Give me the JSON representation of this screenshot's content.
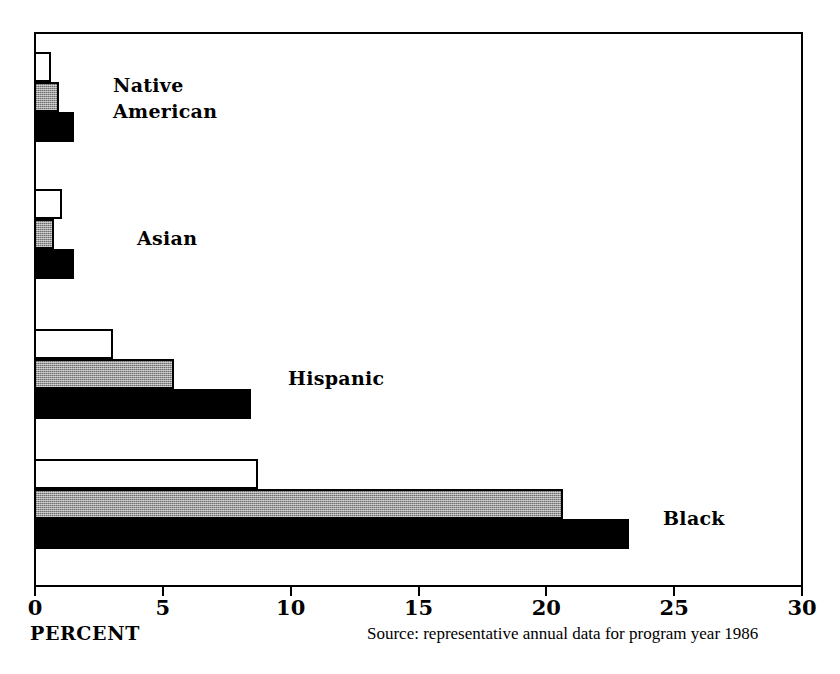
{
  "chart_data": {
    "type": "bar",
    "orientation": "horizontal",
    "title": "",
    "xlabel": "PERCENT",
    "ylabel": "",
    "xlim": [
      0,
      30
    ],
    "xticks": [
      0,
      5,
      10,
      15,
      20,
      25,
      30
    ],
    "xtick_labels": [
      "0",
      "5",
      "10",
      "15",
      "20",
      "25",
      "30"
    ],
    "grid": false,
    "legend": "none",
    "categories": [
      "Native American",
      "Asian",
      "Hispanic",
      "Black"
    ],
    "series": [
      {
        "name": "white",
        "fill": "white",
        "values": [
          0.6,
          1.0,
          3.0,
          8.7
        ]
      },
      {
        "name": "gray",
        "fill": "gray",
        "values": [
          0.9,
          0.7,
          5.4,
          20.6
        ]
      },
      {
        "name": "black",
        "fill": "black",
        "values": [
          1.5,
          1.5,
          8.4,
          23.2
        ]
      }
    ],
    "annotations": [
      "Source: representative annual data for program year 1986"
    ]
  },
  "axis": {
    "title": "PERCENT",
    "ticks": [
      {
        "value": "0",
        "pos": 0
      },
      {
        "value": "5",
        "pos": 5
      },
      {
        "value": "10",
        "pos": 10
      },
      {
        "value": "15",
        "pos": 15
      },
      {
        "value": "20",
        "pos": 20
      },
      {
        "value": "25",
        "pos": 25
      },
      {
        "value": "30",
        "pos": 30
      }
    ]
  },
  "groups": [
    {
      "label": "Native\nAmerican",
      "label_x": 113,
      "label_y": 72
    },
    {
      "label": "Asian",
      "label_x": 137,
      "label_y": 225
    },
    {
      "label": "Hispanic",
      "label_x": 288,
      "label_y": 365
    },
    {
      "label": "Black",
      "label_x": 663,
      "label_y": 505
    }
  ],
  "footer": {
    "source": "Source: representative annual data for program year 1986"
  },
  "colors": {
    "bar_white": "#ffffff",
    "bar_gray": "#9c9c9c",
    "bar_black": "#000000",
    "outline": "#000000",
    "background": "#ffffff"
  }
}
